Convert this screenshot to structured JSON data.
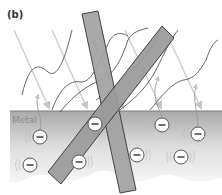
{
  "figure": {
    "panel_label": "(b)",
    "metal_label": "Metal"
  },
  "colors": {
    "background": "#ffffff",
    "metal_top": "#a9a9a9",
    "metal_bottom": "#f4f4f4",
    "bar_fill": "#9e9e9e",
    "bar_stroke": "#3a3a3a",
    "ray_color": "#c8c8c8",
    "wave_color": "#555555",
    "electron_fill": "#ffffff",
    "electron_stroke": "#555555"
  },
  "electrons": [
    {
      "x": 40,
      "y": 137,
      "symbol": "−"
    },
    {
      "x": 30,
      "y": 165,
      "symbol": "−"
    },
    {
      "x": 95,
      "y": 124,
      "symbol": "−"
    },
    {
      "x": 79,
      "y": 162,
      "symbol": "−"
    },
    {
      "x": 162,
      "y": 125,
      "symbol": "−"
    },
    {
      "x": 137,
      "y": 155,
      "symbol": "−"
    },
    {
      "x": 198,
      "y": 134,
      "symbol": "−"
    },
    {
      "x": 181,
      "y": 157,
      "symbol": "−"
    }
  ]
}
